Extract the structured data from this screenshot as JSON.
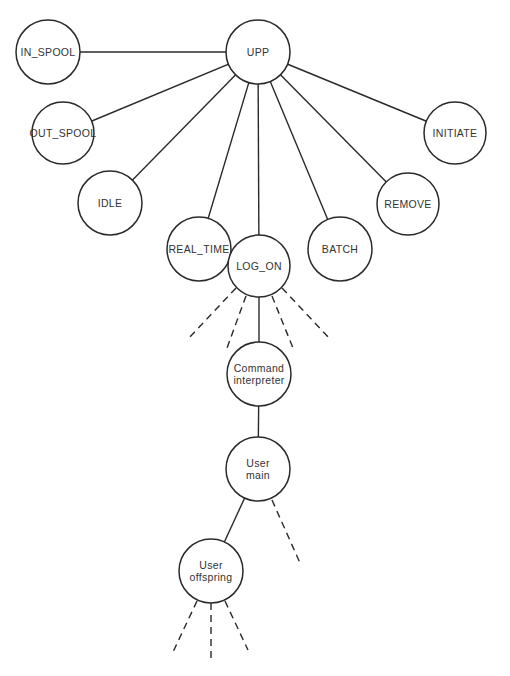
{
  "diagram": {
    "type": "process-tree",
    "colors": {
      "stroke": "#2a2a2a",
      "text": "#333333",
      "background": "#ffffff"
    },
    "nodes": [
      {
        "id": "upp",
        "label": "UPP",
        "line1": "UPP",
        "line2": "",
        "cx": 258,
        "cy": 52,
        "r": 32
      },
      {
        "id": "in_spool",
        "label": "IN_SPOOL",
        "line1": "IN_SPOOL",
        "line2": "",
        "cx": 48,
        "cy": 52,
        "r": 32
      },
      {
        "id": "out_spool",
        "label": "OUT_SPOOL",
        "line1": "OUT_SPOOL",
        "line2": "",
        "cx": 63,
        "cy": 133,
        "r": 31
      },
      {
        "id": "idle",
        "label": "IDLE",
        "line1": "IDLE",
        "line2": "",
        "cx": 110,
        "cy": 203,
        "r": 32
      },
      {
        "id": "real_time",
        "label": "REAL_TIME",
        "line1": "REAL_TIME",
        "line2": "",
        "cx": 199,
        "cy": 249,
        "r": 32
      },
      {
        "id": "log_on",
        "label": "LOG_ON",
        "line1": "LOG_ON",
        "line2": "",
        "cx": 259,
        "cy": 266,
        "r": 31
      },
      {
        "id": "batch",
        "label": "BATCH",
        "line1": "BATCH",
        "line2": "",
        "cx": 340,
        "cy": 249,
        "r": 32
      },
      {
        "id": "remove",
        "label": "REMOVE",
        "line1": "REMOVE",
        "line2": "",
        "cx": 408,
        "cy": 204,
        "r": 31
      },
      {
        "id": "initiate",
        "label": "INITIATE",
        "line1": "INITIATE",
        "line2": "",
        "cx": 455,
        "cy": 133,
        "r": 31
      },
      {
        "id": "command_interpreter",
        "label": "Command interpreter",
        "line1": "Command",
        "line2": "interpreter",
        "cx": 259,
        "cy": 374,
        "r": 32
      },
      {
        "id": "user_main",
        "label": "User main",
        "line1": "User",
        "line2": "main",
        "cx": 258,
        "cy": 469,
        "r": 32
      },
      {
        "id": "user_offspring",
        "label": "User offspring",
        "line1": "User",
        "line2": "offspring",
        "cx": 211,
        "cy": 571,
        "r": 32
      }
    ],
    "edges": [
      {
        "from": "upp",
        "to": "in_spool",
        "style": "solid"
      },
      {
        "from": "upp",
        "to": "out_spool",
        "style": "solid"
      },
      {
        "from": "upp",
        "to": "idle",
        "style": "solid"
      },
      {
        "from": "upp",
        "to": "real_time",
        "style": "solid"
      },
      {
        "from": "upp",
        "to": "log_on",
        "style": "solid"
      },
      {
        "from": "upp",
        "to": "batch",
        "style": "solid"
      },
      {
        "from": "upp",
        "to": "remove",
        "style": "solid"
      },
      {
        "from": "upp",
        "to": "initiate",
        "style": "solid"
      },
      {
        "from": "log_on",
        "to": "command_interpreter",
        "style": "solid"
      },
      {
        "from": "command_interpreter",
        "to": "user_main",
        "style": "solid"
      },
      {
        "from": "user_main",
        "to": "user_offspring",
        "style": "solid"
      }
    ],
    "dangling_dashed_edges": [
      {
        "from": "log_on",
        "x1": 236,
        "y1": 288,
        "x2": 188,
        "y2": 339
      },
      {
        "from": "log_on",
        "x1": 246,
        "y1": 296,
        "x2": 227,
        "y2": 348
      },
      {
        "from": "log_on",
        "x1": 272,
        "y1": 296,
        "x2": 293,
        "y2": 348
      },
      {
        "from": "log_on",
        "x1": 282,
        "y1": 288,
        "x2": 330,
        "y2": 339
      },
      {
        "from": "user_main",
        "x1": 272,
        "y1": 500,
        "x2": 300,
        "y2": 563
      },
      {
        "from": "user_offspring",
        "x1": 197,
        "y1": 601,
        "x2": 173,
        "y2": 652
      },
      {
        "from": "user_offspring",
        "x1": 211,
        "y1": 603,
        "x2": 211,
        "y2": 662
      },
      {
        "from": "user_offspring",
        "x1": 225,
        "y1": 601,
        "x2": 248,
        "y2": 650
      }
    ]
  }
}
